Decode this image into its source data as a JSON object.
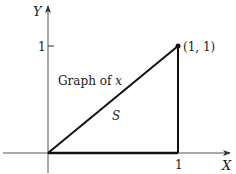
{
  "diagram": {
    "axes": {
      "x_label": "X",
      "y_label": "Y",
      "x_tick_label": "1",
      "y_tick_label": "1"
    },
    "point_label": "(1, 1)",
    "curve_label_prefix": "Graph of ",
    "curve_label_var": "x",
    "region_label": "S",
    "colors": {
      "line": "#111111",
      "axis": "#333333",
      "background": "#ffffff"
    }
  }
}
